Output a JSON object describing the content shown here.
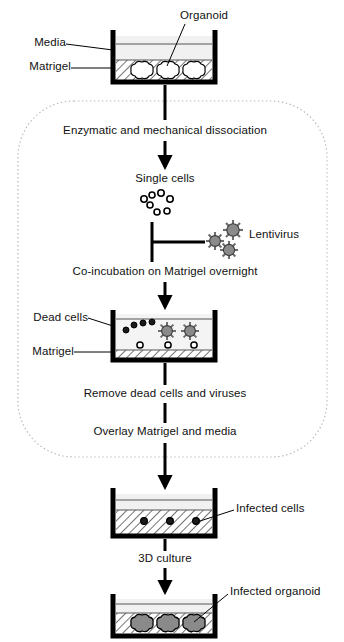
{
  "figure": {
    "type": "flow-diagram",
    "background": "#ffffff",
    "ink": "#000000",
    "virus_fill": "#8a8a8a",
    "organoid_fill": "#8a8a8a",
    "media_fill": "#f0f0f0"
  },
  "labels": {
    "organoid": "Organoid",
    "media": "Media",
    "matrigel_top": "Matrigel",
    "enzymatic": "Enzymatic and mechanical dissociation",
    "single_cells": "Single cells",
    "lentivirus": "Lentivirus",
    "coincubation": "Co-incubation on Matrigel overnight",
    "dead_cells": "Dead cells",
    "matrigel_mid": "Matrigel",
    "remove": "Remove dead cells and viruses",
    "overlay": "Overlay Matrigel and media",
    "infected_cells": "Infected cells",
    "three_d_culture": "3D culture",
    "infected_organoid": "Infected organoid"
  },
  "steps": [
    {
      "id": "step-1",
      "label": "Organoid",
      "kind": "dish"
    },
    {
      "id": "step-2",
      "label": "Enzymatic and mechanical dissociation",
      "kind": "process"
    },
    {
      "id": "step-3",
      "label": "Single cells",
      "kind": "state"
    },
    {
      "id": "step-4",
      "label": "Lentivirus",
      "kind": "input"
    },
    {
      "id": "step-5",
      "label": "Co-incubation on Matrigel overnight",
      "kind": "process"
    },
    {
      "id": "step-6",
      "label": "Remove dead cells and viruses",
      "kind": "process"
    },
    {
      "id": "step-7",
      "label": "Overlay Matrigel and media",
      "kind": "process"
    },
    {
      "id": "step-8",
      "label": "Infected cells",
      "kind": "dish"
    },
    {
      "id": "step-9",
      "label": "3D culture",
      "kind": "process"
    },
    {
      "id": "step-10",
      "label": "Infected organoid",
      "kind": "dish"
    }
  ],
  "dishes": [
    {
      "id": "dish-organoid",
      "contents": [
        "Media",
        "Matrigel",
        "Organoid"
      ],
      "organoid_count": 3
    },
    {
      "id": "dish-coincubation",
      "contents": [
        "Dead cells",
        "Matrigel",
        "Lentivirus",
        "Single cells"
      ],
      "virus_count": 2,
      "dead_cell_count": 4,
      "cell_count": 3
    },
    {
      "id": "dish-infected-cells",
      "contents": [
        "Media",
        "Matrigel",
        "Infected cells"
      ],
      "infected_cell_count": 3
    },
    {
      "id": "dish-infected-organoid",
      "contents": [
        "Media",
        "Matrigel",
        "Infected organoid"
      ],
      "organoid_count": 3
    }
  ]
}
